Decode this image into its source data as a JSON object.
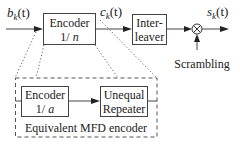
{
  "diagram": {
    "signals": {
      "input": "b",
      "input_sub": "k",
      "input_arg": "(t)",
      "coded": "c",
      "coded_sub": "k",
      "coded_arg": "(t)",
      "output": "s",
      "output_sub": "k",
      "output_arg": "(t)"
    },
    "blocks": {
      "encoder": {
        "line1": "Encoder",
        "line2_prefix": "1/ ",
        "line2_var": "n"
      },
      "interleaver": {
        "line1": "Inter-",
        "line2": "leaver"
      },
      "multiplier": {
        "symbol": "⊗"
      },
      "scrambling": {
        "label": "Scrambling"
      }
    },
    "equivalent": {
      "title": "Equivalent MFD encoder",
      "encoder": {
        "line1": "Encoder",
        "line2_prefix": "1/ ",
        "line2_var": "a"
      },
      "repeater": {
        "line1": "Unequal",
        "line2": "Repeater"
      }
    }
  }
}
